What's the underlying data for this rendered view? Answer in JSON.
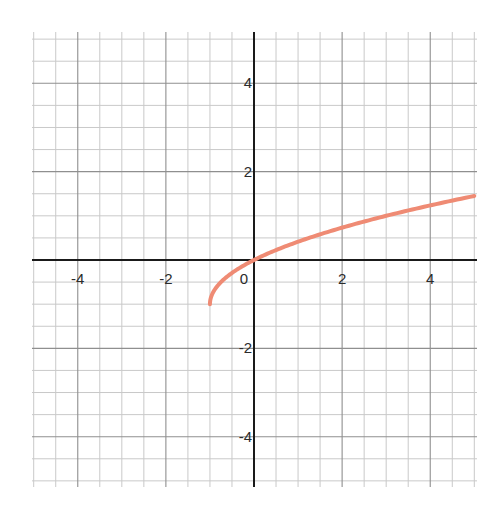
{
  "chart_data": {
    "type": "line",
    "title": "",
    "xlabel": "",
    "ylabel": "",
    "xlim": [
      -5,
      5
    ],
    "ylim": [
      -5,
      5
    ],
    "grid": true,
    "minor_step": 0.5,
    "major_step": 2,
    "x_tick_labels": [
      {
        "value": -4,
        "label": "-4"
      },
      {
        "value": -2,
        "label": "-2"
      },
      {
        "value": 0,
        "label": "0"
      },
      {
        "value": 2,
        "label": "2"
      },
      {
        "value": 4,
        "label": "4"
      }
    ],
    "y_tick_labels": [
      {
        "value": 4,
        "label": "4"
      },
      {
        "value": 2,
        "label": "2"
      },
      {
        "value": -2,
        "label": "-2"
      },
      {
        "value": -4,
        "label": "-4"
      }
    ],
    "series": [
      {
        "name": "curve",
        "function": "sqrt(x+1)-1",
        "color": "#ef8b74",
        "domain": [
          -1,
          5
        ],
        "points": [
          [
            -1,
            -1
          ],
          [
            -0.9,
            -0.684
          ],
          [
            -0.75,
            -0.5
          ],
          [
            -0.5,
            -0.293
          ],
          [
            0,
            0
          ],
          [
            0.5,
            0.225
          ],
          [
            1,
            0.414
          ],
          [
            1.5,
            0.581
          ],
          [
            2,
            0.732
          ],
          [
            2.5,
            0.871
          ],
          [
            3,
            1.0
          ],
          [
            3.5,
            1.121
          ],
          [
            4,
            1.236
          ],
          [
            4.5,
            1.345
          ],
          [
            5,
            1.449
          ]
        ]
      }
    ]
  }
}
